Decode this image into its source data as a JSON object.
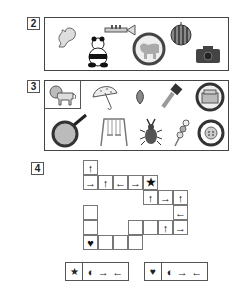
{
  "sections": [
    {
      "number": "2",
      "items": [
        {
          "name": "squirrel"
        },
        {
          "name": "panda"
        },
        {
          "name": "trumpet"
        },
        {
          "name": "horse-in-circle"
        },
        {
          "name": "watermelon"
        },
        {
          "name": "camera"
        }
      ]
    },
    {
      "number": "3",
      "items": [
        {
          "name": "lion"
        },
        {
          "name": "umbrella"
        },
        {
          "name": "pinecone"
        },
        {
          "name": "hammer"
        },
        {
          "name": "rice-cooker-in-circle"
        },
        {
          "name": "frying-pan"
        },
        {
          "name": "swing"
        },
        {
          "name": "stag-beetle"
        },
        {
          "name": "dango"
        },
        {
          "name": "button-in-circle"
        }
      ]
    },
    {
      "number": "4",
      "grid": {
        "cells": [
          {
            "row": 0,
            "col": 0,
            "symbol": "↑"
          },
          {
            "row": 1,
            "col": 0,
            "symbol": "→"
          },
          {
            "row": 1,
            "col": 1,
            "symbol": "↑"
          },
          {
            "row": 1,
            "col": 2,
            "symbol": "←"
          },
          {
            "row": 1,
            "col": 3,
            "symbol": "→"
          },
          {
            "row": 1,
            "col": 4,
            "symbol": "★"
          },
          {
            "row": 2,
            "col": 4,
            "symbol": "↑"
          },
          {
            "row": 2,
            "col": 5,
            "symbol": "→"
          },
          {
            "row": 2,
            "col": 6,
            "symbol": "↑"
          },
          {
            "row": 3,
            "col": 0,
            "symbol": ""
          },
          {
            "row": 3,
            "col": 6,
            "symbol": "←"
          },
          {
            "row": 4,
            "col": 0,
            "symbol": ""
          },
          {
            "row": 4,
            "col": 3,
            "symbol": ""
          },
          {
            "row": 4,
            "col": 4,
            "symbol": ""
          },
          {
            "row": 4,
            "col": 5,
            "symbol": "↑"
          },
          {
            "row": 4,
            "col": 6,
            "symbol": "→"
          },
          {
            "row": 5,
            "col": 0,
            "symbol": "♥"
          },
          {
            "row": 5,
            "col": 1,
            "symbol": ""
          },
          {
            "row": 5,
            "col": 2,
            "symbol": ""
          },
          {
            "row": 5,
            "col": 3,
            "symbol": ""
          }
        ]
      },
      "keys": [
        {
          "start": "★",
          "rule": [
            "◐",
            "→",
            "←"
          ]
        },
        {
          "start": "♥",
          "rule": [
            "◐",
            "→",
            "←"
          ]
        }
      ]
    }
  ]
}
